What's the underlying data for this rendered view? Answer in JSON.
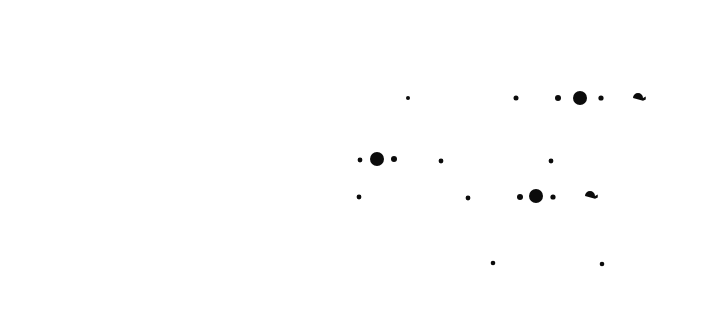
{
  "scene": {
    "title": "Dot Pattern",
    "width": 704,
    "height": 325,
    "background_color": "#ffffff",
    "ink_color": "#0b0b0b",
    "description": "Scattered black dots of varying size on a plain white field, clustered in the right-central area of the frame.",
    "mark_count": 19,
    "size_classes": {
      "small": 2.0,
      "medium": 2.6,
      "large": 3.2,
      "xlarge": 7.0,
      "teardrop": 5.0
    }
  },
  "marks": [
    {
      "id": "m01",
      "group": "row-top",
      "shape": "circle",
      "cx": 408,
      "cy": 98,
      "r": 2.0,
      "size_class": "small"
    },
    {
      "id": "m02",
      "group": "row-top",
      "shape": "circle",
      "cx": 516,
      "cy": 98,
      "r": 2.5,
      "size_class": "medium"
    },
    {
      "id": "m03",
      "group": "row-top",
      "shape": "circle",
      "cx": 558,
      "cy": 98,
      "r": 3.0,
      "size_class": "large"
    },
    {
      "id": "m04",
      "group": "row-top",
      "shape": "circle",
      "cx": 580,
      "cy": 98,
      "r": 7.0,
      "size_class": "xlarge"
    },
    {
      "id": "m05",
      "group": "row-top",
      "shape": "circle",
      "cx": 601,
      "cy": 98,
      "r": 2.6,
      "size_class": "medium"
    },
    {
      "id": "m06",
      "group": "row-top",
      "shape": "teardrop",
      "cx": 638,
      "cy": 98,
      "r": 5.0,
      "size_class": "teardrop",
      "point_dir": "right"
    },
    {
      "id": "m07",
      "group": "row-middle",
      "shape": "circle",
      "cx": 360,
      "cy": 160,
      "r": 2.4,
      "size_class": "medium"
    },
    {
      "id": "m08",
      "group": "row-middle",
      "shape": "circle",
      "cx": 377,
      "cy": 159,
      "r": 7.0,
      "size_class": "xlarge"
    },
    {
      "id": "m09",
      "group": "row-middle",
      "shape": "circle",
      "cx": 394,
      "cy": 159,
      "r": 3.0,
      "size_class": "large"
    },
    {
      "id": "m10",
      "group": "row-middle",
      "shape": "circle",
      "cx": 441,
      "cy": 161,
      "r": 2.4,
      "size_class": "medium"
    },
    {
      "id": "m11",
      "group": "row-middle",
      "shape": "circle",
      "cx": 551,
      "cy": 161,
      "r": 2.4,
      "size_class": "medium"
    },
    {
      "id": "m12",
      "group": "row-lower",
      "shape": "circle",
      "cx": 359,
      "cy": 197,
      "r": 2.4,
      "size_class": "medium"
    },
    {
      "id": "m13",
      "group": "row-lower",
      "shape": "circle",
      "cx": 468,
      "cy": 198,
      "r": 2.4,
      "size_class": "medium"
    },
    {
      "id": "m14",
      "group": "row-lower",
      "shape": "circle",
      "cx": 520,
      "cy": 197,
      "r": 3.0,
      "size_class": "large"
    },
    {
      "id": "m15",
      "group": "row-lower",
      "shape": "circle",
      "cx": 536,
      "cy": 196,
      "r": 7.0,
      "size_class": "xlarge"
    },
    {
      "id": "m16",
      "group": "row-lower",
      "shape": "circle",
      "cx": 553,
      "cy": 197,
      "r": 2.6,
      "size_class": "medium"
    },
    {
      "id": "m17",
      "group": "row-lower",
      "shape": "teardrop",
      "cx": 590,
      "cy": 196,
      "r": 5.0,
      "size_class": "teardrop",
      "point_dir": "right"
    },
    {
      "id": "m18",
      "group": "row-bottom",
      "shape": "circle",
      "cx": 493,
      "cy": 263,
      "r": 2.3,
      "size_class": "medium"
    },
    {
      "id": "m19",
      "group": "row-bottom",
      "shape": "circle",
      "cx": 602,
      "cy": 264,
      "r": 2.3,
      "size_class": "medium"
    }
  ]
}
